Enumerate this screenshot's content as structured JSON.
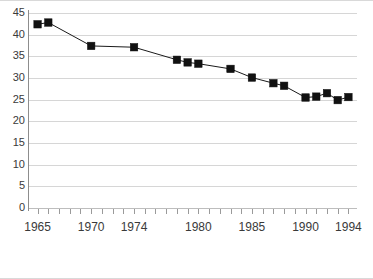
{
  "chart_data": {
    "type": "line",
    "title": "",
    "subtitle": "",
    "xlabel": "",
    "ylabel": "",
    "xlim": [
      1964.2,
      1994.8
    ],
    "ylim": [
      0,
      45
    ],
    "grid": true,
    "legend": false,
    "marker": "square",
    "line_color": "#1a1a1a",
    "marker_color": "#111111",
    "grid_color": "#d6d6d6",
    "y_ticks": [
      0,
      5,
      10,
      15,
      20,
      25,
      30,
      35,
      40,
      45
    ],
    "y_tick_labels": [
      "0",
      "5",
      "10",
      "15",
      "20",
      "25",
      "30",
      "35",
      "40",
      "45"
    ],
    "x_tick_labels": [
      "1965",
      "1970",
      "1974",
      "1980",
      "1985",
      "1990",
      "1994"
    ],
    "x_tick_label_years": [
      1965,
      1970,
      1974,
      1980,
      1985,
      1990,
      1994
    ],
    "x_minor_tick_years": [
      1965,
      1966,
      1967,
      1968,
      1969,
      1970,
      1971,
      1972,
      1973,
      1974,
      1975,
      1976,
      1977,
      1978,
      1979,
      1980,
      1981,
      1982,
      1983,
      1984,
      1985,
      1986,
      1987,
      1988,
      1989,
      1990,
      1991,
      1992,
      1993,
      1994
    ],
    "x": [
      1965,
      1966,
      1970,
      1974,
      1978,
      1979,
      1980,
      1983,
      1985,
      1987,
      1988,
      1990,
      1991,
      1992,
      1993,
      1994
    ],
    "values": [
      42.4,
      42.8,
      37.4,
      37.1,
      34.2,
      33.6,
      33.3,
      32.1,
      30.1,
      28.8,
      28.2,
      25.5,
      25.7,
      26.5,
      24.9,
      25.6
    ],
    "series": [
      {
        "name": "series-1",
        "points": [
          {
            "x": 1965,
            "y": 42.4
          },
          {
            "x": 1966,
            "y": 42.8
          },
          {
            "x": 1970,
            "y": 37.4
          },
          {
            "x": 1974,
            "y": 37.1
          },
          {
            "x": 1978,
            "y": 34.2
          },
          {
            "x": 1979,
            "y": 33.6
          },
          {
            "x": 1980,
            "y": 33.3
          },
          {
            "x": 1983,
            "y": 32.1
          },
          {
            "x": 1985,
            "y": 30.1
          },
          {
            "x": 1987,
            "y": 28.8
          },
          {
            "x": 1988,
            "y": 28.2
          },
          {
            "x": 1990,
            "y": 25.5
          },
          {
            "x": 1991,
            "y": 25.7
          },
          {
            "x": 1992,
            "y": 26.5
          },
          {
            "x": 1993,
            "y": 24.9
          },
          {
            "x": 1994,
            "y": 25.6
          }
        ]
      }
    ]
  }
}
